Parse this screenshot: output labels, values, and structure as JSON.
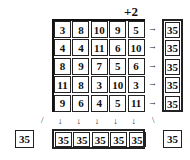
{
  "offset_label": "+2",
  "grid": [
    [
      3,
      8,
      10,
      9,
      5
    ],
    [
      4,
      4,
      11,
      6,
      10
    ],
    [
      8,
      9,
      7,
      5,
      6
    ],
    [
      11,
      8,
      3,
      10,
      3
    ],
    [
      9,
      6,
      4,
      5,
      11
    ]
  ],
  "row_sums": [
    "35",
    "35",
    "35",
    "35",
    "35"
  ],
  "col_sums": [
    "35",
    "35",
    "35",
    "35",
    "35"
  ],
  "diag_left_sum": "35",
  "diag_right_sum": "35",
  "arrows": {
    "right": "→",
    "down": "↓",
    "diag_left": "/",
    "diag_right": "\\"
  }
}
